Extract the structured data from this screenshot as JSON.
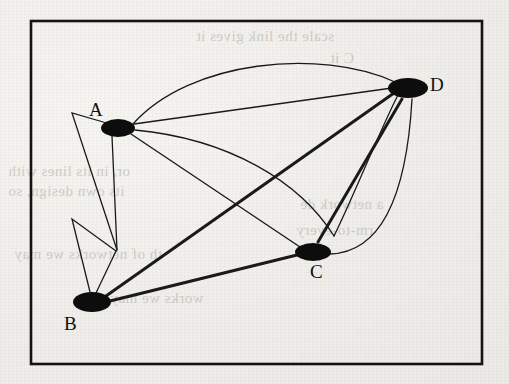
{
  "page": {
    "kind": "scanned-book-page",
    "background_color": "#efeeea",
    "ink_color": "#121212"
  },
  "figure": {
    "title": "",
    "type": "graph-diagram",
    "border": {
      "x": 31,
      "y": 21,
      "width": 451,
      "height": 343,
      "color": "#111111"
    },
    "nodes": [
      {
        "id": "A",
        "label": "A",
        "x": 118,
        "y": 128,
        "rx": 17,
        "ry": 9,
        "label_x": 89,
        "label_y": 99
      },
      {
        "id": "B",
        "label": "B",
        "x": 92,
        "y": 302,
        "rx": 19,
        "ry": 10,
        "label_x": 64,
        "label_y": 313
      },
      {
        "id": "C",
        "label": "C",
        "x": 313,
        "y": 252,
        "rx": 18,
        "ry": 9,
        "label_x": 310,
        "label_y": 261
      },
      {
        "id": "D",
        "label": "D",
        "x": 408,
        "y": 88,
        "rx": 20,
        "ry": 10,
        "label_x": 430,
        "label_y": 74
      }
    ],
    "edges": [
      {
        "id": "AD-arc-upper",
        "from": "A",
        "to": "D",
        "style": "thin-arc",
        "note": "high arc above A and D"
      },
      {
        "id": "AD-straight",
        "from": "A",
        "to": "D",
        "style": "thin-straight",
        "note": "direct line"
      },
      {
        "id": "AD-arc-lower",
        "from": "A",
        "to": "D",
        "style": "thin-arc",
        "note": "arc sagging below, crossing B-D"
      },
      {
        "id": "AC",
        "from": "A",
        "to": "C",
        "style": "thin-straight"
      },
      {
        "id": "BD",
        "from": "B",
        "to": "D",
        "style": "thick-straight"
      },
      {
        "id": "BC",
        "from": "B",
        "to": "C",
        "style": "thick-straight"
      },
      {
        "id": "CD-straight",
        "from": "C",
        "to": "D",
        "style": "thick-straight"
      },
      {
        "id": "CD-arc",
        "from": "C",
        "to": "D",
        "style": "thin-arc",
        "note": "arc bulging to the right"
      },
      {
        "id": "A-loop",
        "from": "A",
        "to": "A",
        "style": "thin-zigzag",
        "note": "narrow V loop at A reaching down-left"
      },
      {
        "id": "B-loop",
        "from": "B",
        "to": "B",
        "style": "thin-zigzag",
        "note": "narrow V loop at B reaching up"
      }
    ]
  },
  "show_through_text": {
    "line1": "scale the link gives it",
    "line2": "C it",
    "line3": "or, in its lines with",
    "line4": "its own design, so",
    "line5": "th of networks we may",
    "line6": "a network de",
    "line7": "rm-to-every",
    "line8": "works we may"
  }
}
